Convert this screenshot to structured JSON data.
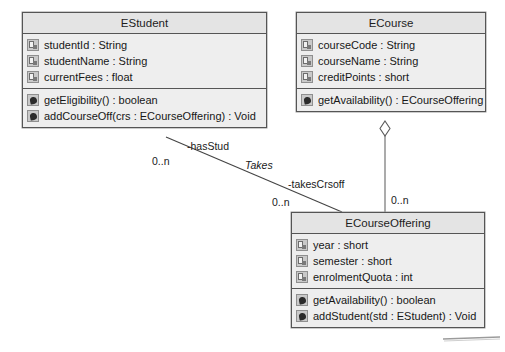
{
  "diagram": {
    "type": "uml-class-diagram",
    "background_color": "#ffffff",
    "line_color": "#555555",
    "box_fill": "#eeeeee",
    "header_fill": "#e4e4e4"
  },
  "classes": [
    {
      "id": "estudent",
      "name": "EStudent",
      "attributes": [
        {
          "icon": "attribute-icon",
          "text": "studentId : String"
        },
        {
          "icon": "attribute-icon",
          "text": "studentName : String"
        },
        {
          "icon": "attribute-icon",
          "text": "currentFees : float"
        }
      ],
      "operations": [
        {
          "icon": "method-icon",
          "text": "getEligibility() : boolean"
        },
        {
          "icon": "method-icon",
          "text": "addCourseOff(crs : ECourseOffering) : Void"
        }
      ]
    },
    {
      "id": "ecourse",
      "name": "ECourse",
      "attributes": [
        {
          "icon": "attribute-icon",
          "text": "courseCode : String"
        },
        {
          "icon": "attribute-icon",
          "text": "courseName : String"
        },
        {
          "icon": "attribute-icon",
          "text": "creditPoints : short"
        }
      ],
      "operations": [
        {
          "icon": "method-icon",
          "text": "getAvailability() : ECourseOffering"
        }
      ]
    },
    {
      "id": "ecourseoffering",
      "name": "ECourseOffering",
      "attributes": [
        {
          "icon": "attribute-icon",
          "text": "year : short"
        },
        {
          "icon": "attribute-icon",
          "text": "semester : short"
        },
        {
          "icon": "attribute-icon",
          "text": "enrolmentQuota : int"
        }
      ],
      "operations": [
        {
          "icon": "method-icon",
          "text": "getAvailability() : boolean"
        },
        {
          "icon": "method-icon",
          "text": "addStudent(std : EStudent) : Void"
        }
      ]
    }
  ],
  "relationships": [
    {
      "id": "takes",
      "kind": "association",
      "name": "Takes",
      "from": "EStudent",
      "to": "ECourseOffering",
      "source_role": "-hasStud",
      "source_multiplicity": "0..n",
      "target_role": "-takesCrsoff",
      "target_multiplicity": "0..n"
    },
    {
      "id": "course-offering-aggregation",
      "kind": "aggregation",
      "from": "ECourse",
      "to": "ECourseOffering",
      "target_multiplicity": "0..n"
    }
  ],
  "labels": {
    "has_stud": "-hasStud",
    "takes": "Takes",
    "takes_crsoff": "-takesCrsoff",
    "mult_student_end": "0..n",
    "mult_offering_end": "0..n",
    "mult_aggregation_end": "0..n"
  }
}
